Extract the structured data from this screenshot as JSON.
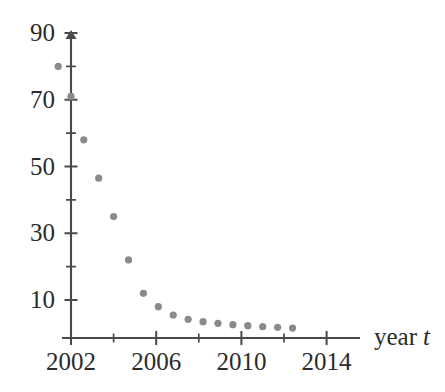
{
  "chart_data": {
    "type": "scatter",
    "title": "",
    "subtitle": "",
    "xlabel": "year t",
    "ylabel": "",
    "grid": false,
    "legend": "none",
    "marker_color": "#8a8a8a",
    "axis_color": "#4a4a4a",
    "background_color": "#ffffff",
    "xlim": [
      2000.6,
      2014.8
    ],
    "ylim": [
      0,
      90
    ],
    "x_tick_step": 2,
    "y_tick_step": 10,
    "x_ticks": [
      2002,
      2004,
      2006,
      2008,
      2010,
      2012,
      2014
    ],
    "x_tick_labels": [
      "2002",
      "",
      "2006",
      "",
      "2010",
      "",
      "2014"
    ],
    "y_ticks": [
      10,
      20,
      30,
      40,
      50,
      60,
      70,
      80,
      90
    ],
    "y_tick_labels": [
      "10",
      "",
      "30",
      "",
      "50",
      "",
      "70",
      "",
      "90"
    ],
    "x": [
      2001.4,
      2002.0,
      2002.6,
      2003.3,
      2004.0,
      2004.7,
      2005.4,
      2006.1,
      2006.8,
      2007.5,
      2008.2,
      2008.9,
      2009.6,
      2010.3,
      2011.0,
      2011.7,
      2012.4
    ],
    "values": [
      80.0,
      71.0,
      58.0,
      46.5,
      35.0,
      22.0,
      12.0,
      8.0,
      5.5,
      4.2,
      3.5,
      3.0,
      2.6,
      2.3,
      2.0,
      1.8,
      1.6
    ],
    "points": [
      {
        "x": 2001.4,
        "y": 80.0
      },
      {
        "x": 2002.0,
        "y": 71.0
      },
      {
        "x": 2002.6,
        "y": 58.0
      },
      {
        "x": 2003.3,
        "y": 46.5
      },
      {
        "x": 2004.0,
        "y": 35.0
      },
      {
        "x": 2004.7,
        "y": 22.0
      },
      {
        "x": 2005.4,
        "y": 12.0
      },
      {
        "x": 2006.1,
        "y": 8.0
      },
      {
        "x": 2006.8,
        "y": 5.5
      },
      {
        "x": 2007.5,
        "y": 4.2
      },
      {
        "x": 2008.2,
        "y": 3.5
      },
      {
        "x": 2008.9,
        "y": 3.0
      },
      {
        "x": 2009.6,
        "y": 2.6
      },
      {
        "x": 2010.3,
        "y": 2.3
      },
      {
        "x": 2011.0,
        "y": 2.0
      },
      {
        "x": 2011.7,
        "y": 1.8
      },
      {
        "x": 2012.4,
        "y": 1.6
      }
    ]
  },
  "axes": {
    "x_axis_label_main": "year",
    "x_axis_label_var": "t",
    "y_labels": [
      {
        "text": "90",
        "value": 90
      },
      {
        "text": "70",
        "value": 70
      },
      {
        "text": "50",
        "value": 50
      },
      {
        "text": "30",
        "value": 30
      },
      {
        "text": "10",
        "value": 10
      }
    ],
    "x_labels": [
      {
        "text": "2002",
        "value": 2002
      },
      {
        "text": "2006",
        "value": 2006
      },
      {
        "text": "2010",
        "value": 2010
      },
      {
        "text": "2014",
        "value": 2014
      }
    ]
  }
}
